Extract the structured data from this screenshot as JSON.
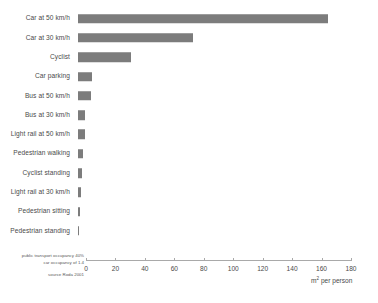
{
  "chart_data": {
    "type": "bar",
    "orientation": "horizontal",
    "title": "",
    "xlabel": "m² per person",
    "ylabel": "",
    "xlim": [
      0,
      180
    ],
    "xticks": [
      0,
      20,
      40,
      60,
      80,
      100,
      120,
      140,
      160,
      180
    ],
    "grid": false,
    "legend": null,
    "bar_color": "#7c7c7c",
    "categories": [
      "Car at 50 km/h",
      "Car at 30 km/h",
      "Cyclist",
      "Car parking",
      "Bus at 50 km/h",
      "Bus at 30 km/h",
      "Light rail at 50 km/h",
      "Pedestrian walking",
      "Cyclist standing",
      "Light rail at 30 km/h",
      "Pedestrian sitting",
      "Pedestrian standing"
    ],
    "values": [
      170,
      78,
      36,
      9.5,
      9,
      5,
      4.5,
      3.5,
      2.5,
      2,
      1.5,
      0.5
    ],
    "annotations": [
      "public transport occupancy 40%",
      "car occupancy of 1.4",
      "source Roda 2001"
    ]
  },
  "footnotes": {
    "assumption_line_1": "public transport occupancy 40%",
    "assumption_line_2": "car occupancy of 1.4",
    "source": "source Roda 2001"
  },
  "axis": {
    "unit_prefix": "m",
    "unit_exponent": "2",
    "unit_suffix": " per person"
  }
}
